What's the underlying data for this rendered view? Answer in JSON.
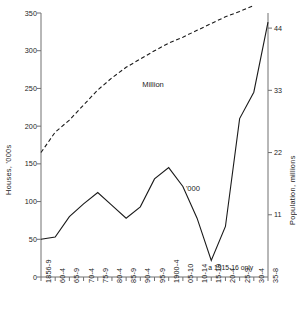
{
  "chart_data": {
    "type": "line",
    "title": "",
    "subtitle": "",
    "grid": false,
    "legend_position": "inline-annotation",
    "x": [
      "1856-9",
      "60-4",
      "65-9",
      "70-4",
      "75-9",
      "80-4",
      "85-9",
      "90-4",
      "95-9",
      "1900-4",
      "05-10",
      "10-14",
      "15-19",
      "20-4",
      "25-9",
      "30-4",
      "35-8"
    ],
    "xlabel": "",
    "ylabel": "Houses, '000s",
    "ylabel_right": "Population, millions",
    "ylim": [
      0,
      350
    ],
    "yticks": [
      0,
      50,
      100,
      150,
      200,
      250,
      300,
      350
    ],
    "ytick_labels": [
      "0",
      "50",
      "100",
      "150",
      "200",
      "250",
      "300",
      "350"
    ],
    "ylim_right": [
      0,
      46.67
    ],
    "yticks_right": [
      11,
      22,
      33,
      44
    ],
    "ytick_labels_right": [
      "11",
      "22",
      "33",
      "44"
    ],
    "series": [
      {
        "name": "'000",
        "label": "'000",
        "style": "solid",
        "axis": "left",
        "color": "#1a1a1a",
        "values": [
          50,
          53,
          80,
          97,
          112,
          95,
          78,
          93,
          130,
          145,
          120,
          78,
          22,
          67,
          210,
          245,
          338
        ]
      },
      {
        "name": "Million",
        "label": "Million",
        "style": "dashed",
        "axis": "left",
        "color": "#1a1a1a",
        "values": [
          165,
          192,
          208,
          228,
          248,
          264,
          278,
          289,
          300,
          310,
          318,
          327,
          336,
          345,
          352,
          360,
          null
        ]
      }
    ],
    "annotations": [
      {
        "text": "a 1915-16 only",
        "x": "15-19",
        "y": 22
      },
      {
        "text": "Million",
        "x": "90-4",
        "y": 268
      },
      {
        "text": "'000",
        "x": "05-10",
        "y": 118
      }
    ]
  },
  "axes": {
    "left_title": "Houses, '000s",
    "right_title": "Population, millions"
  }
}
